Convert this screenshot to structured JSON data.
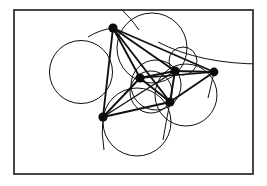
{
  "figure": {
    "background_color": "#ffffff",
    "ink_color": "#111111",
    "frame": {
      "name": "border-rectangle",
      "x": 14,
      "y": 10,
      "width": 239,
      "height": 164,
      "stroke": "#1a1a1a",
      "stroke_width": 1.6
    },
    "view_box": "0 0 267 186",
    "vertices": [
      {
        "id": "v1",
        "label": "top",
        "x": 113,
        "y": 28,
        "r": 4.6
      },
      {
        "id": "v2",
        "label": "center",
        "x": 140,
        "y": 78,
        "r": 4.6
      },
      {
        "id": "v3",
        "label": "mid-right",
        "x": 175,
        "y": 71,
        "r": 4.6
      },
      {
        "id": "v4",
        "label": "far-right",
        "x": 214,
        "y": 72,
        "r": 4.4
      },
      {
        "id": "v5",
        "label": "bottom-left",
        "x": 103,
        "y": 117,
        "r": 4.6
      },
      {
        "id": "v6",
        "label": "lower-mid",
        "x": 170,
        "y": 102,
        "r": 4.6
      }
    ],
    "vertex_color": "#0b0b0b",
    "circles": [
      {
        "id": "c1",
        "label": "large-left-circle",
        "cx": 81,
        "cy": 72,
        "r": 31.5,
        "stroke_width": 1.0
      },
      {
        "id": "c2",
        "label": "bottom-circle",
        "cx": 137,
        "cy": 122,
        "r": 34.0,
        "stroke_width": 1.0
      },
      {
        "id": "c3",
        "label": "top-right-circle",
        "cx": 152,
        "cy": 48,
        "r": 35.0,
        "stroke_width": 1.0
      },
      {
        "id": "c4",
        "label": "right-circle",
        "cx": 186,
        "cy": 95,
        "r": 31.0,
        "stroke_width": 1.0
      },
      {
        "id": "c5",
        "label": "small-upper-right-circle",
        "cx": 183,
        "cy": 61,
        "r": 14.0,
        "stroke_width": 1.0
      },
      {
        "id": "c6",
        "label": "middle-circle",
        "cx": 156,
        "cy": 85,
        "r": 25.0,
        "stroke_width": 1.0
      },
      {
        "id": "c7",
        "label": "small-center-circle",
        "cx": 151,
        "cy": 92,
        "r": 21.0,
        "stroke_width": 1.0
      }
    ],
    "arcs": [
      {
        "id": "a1",
        "label": "outer-right-arc",
        "d": "M 158 42 Q 200 64 262 64",
        "stroke_width": 1.0
      },
      {
        "id": "a2",
        "label": "upper-exit-arc",
        "d": "M 122 10 Q 131 18 139 30",
        "stroke_width": 1.0
      }
    ],
    "edges": [
      {
        "id": "e1",
        "from": "v1",
        "to": "v2",
        "width": 1.9
      },
      {
        "id": "e2",
        "from": "v1",
        "to": "v3",
        "width": 1.9
      },
      {
        "id": "e3",
        "from": "v1",
        "to": "v4",
        "width": 1.9
      },
      {
        "id": "e4",
        "from": "v1",
        "to": "v5",
        "width": 1.9
      },
      {
        "id": "e5",
        "from": "v1",
        "to": "v6",
        "width": 1.9
      },
      {
        "id": "e6",
        "from": "v2",
        "to": "v3",
        "width": 1.9
      },
      {
        "id": "e7",
        "from": "v2",
        "to": "v5",
        "width": 1.9
      },
      {
        "id": "e8",
        "from": "v2",
        "to": "v6",
        "width": 1.9
      },
      {
        "id": "e9",
        "from": "v2",
        "to": "v4",
        "width": 1.6
      },
      {
        "id": "e10",
        "from": "v3",
        "to": "v4",
        "width": 1.9
      },
      {
        "id": "e11",
        "from": "v3",
        "to": "v6",
        "width": 1.9
      },
      {
        "id": "e12",
        "from": "v4",
        "to": "v6",
        "width": 1.9
      },
      {
        "id": "e13",
        "from": "v5",
        "to": "v6",
        "width": 1.9
      },
      {
        "id": "e14",
        "from": "v5",
        "to": "v3",
        "width": 1.4
      }
    ],
    "stray_strokes": [
      {
        "id": "s1",
        "label": "left-tail-from-top-node",
        "d": "M 113 28 Q 99 30 88 37",
        "width": 1.0
      },
      {
        "id": "s2",
        "label": "down-tail-from-bottom-left",
        "d": "M 103 117 Q 101 134 104 150",
        "width": 1.0
      },
      {
        "id": "s3",
        "label": "down-tail-from-lower-mid",
        "d": "M 170 102 Q 166 122 163 140",
        "width": 1.0
      },
      {
        "id": "s4",
        "label": "right-node-down-tail",
        "d": "M 214 72 Q 211 86 208 98",
        "width": 1.0
      }
    ]
  }
}
